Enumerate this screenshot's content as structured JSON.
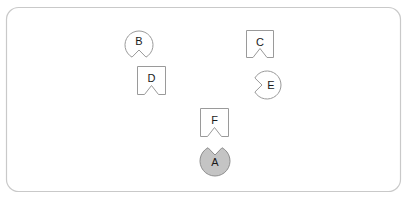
{
  "board": {
    "name": "shape-arrangement-board",
    "width": 409,
    "height": 200,
    "background_color": "#ffffff",
    "frame": {
      "x": 6,
      "y": 7,
      "width": 395,
      "height": 185,
      "corner_radius": 12,
      "stroke_color": "#c9c9c9",
      "fill_color": "none"
    }
  },
  "palette": {
    "outline_stroke": "#9a9a9a",
    "outline_fill": "#ffffff",
    "filled_fill": "#c4c4c4",
    "filled_stroke": "#8d8d8d",
    "label_color": "#1a1a1a"
  },
  "shapes": [
    {
      "id": "shape-a",
      "label": "A",
      "form": "circle",
      "notch_side": "top",
      "fill_style": "filled",
      "fill_color": "#c4c4c4",
      "stroke_color": "#8d8d8d",
      "center_x": 215,
      "center_y": 161,
      "radius": 15,
      "label_x": 215,
      "label_y": 163
    },
    {
      "id": "shape-b",
      "label": "B",
      "form": "circle",
      "notch_side": "bottom",
      "fill_style": "outline",
      "fill_color": "#ffffff",
      "stroke_color": "#9a9a9a",
      "center_x": 139,
      "center_y": 45,
      "radius": 14,
      "label_x": 139,
      "label_y": 42
    },
    {
      "id": "shape-c",
      "label": "C",
      "form": "square",
      "notch_side": "bottom",
      "fill_style": "outline",
      "fill_color": "#ffffff",
      "stroke_color": "#9a9a9a",
      "x": 246,
      "y": 30,
      "size": 28,
      "label_x": 260,
      "label_y": 43
    },
    {
      "id": "shape-d",
      "label": "D",
      "form": "square",
      "notch_side": "bottom",
      "fill_style": "outline",
      "fill_color": "#ffffff",
      "stroke_color": "#9a9a9a",
      "x": 137,
      "y": 66,
      "size": 29,
      "label_x": 151.5,
      "label_y": 79
    },
    {
      "id": "shape-e",
      "label": "E",
      "form": "circle",
      "notch_side": "left",
      "fill_style": "outline",
      "fill_color": "#ffffff",
      "stroke_color": "#9a9a9a",
      "center_x": 267,
      "center_y": 85,
      "radius": 14,
      "label_x": 271,
      "label_y": 86
    },
    {
      "id": "shape-f",
      "label": "F",
      "form": "square",
      "notch_side": "bottom",
      "fill_style": "outline",
      "fill_color": "#ffffff",
      "stroke_color": "#9a9a9a",
      "x": 200,
      "y": 108,
      "size": 29,
      "label_x": 214.5,
      "label_y": 121
    }
  ],
  "notch": {
    "description": "v-shaped wedge cut into the shape edge",
    "half_width": 7,
    "depth": 9
  }
}
